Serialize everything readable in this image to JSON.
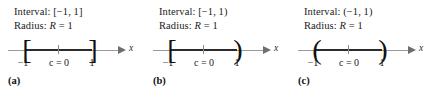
{
  "figure": {
    "type": "number-line-intervals",
    "axis_label": "x",
    "panels": [
      {
        "caption": "(a)",
        "interval_line": "Interval: [−1, 1]",
        "radius_line_prefix": "Radius: ",
        "radius_line_var": "R",
        "radius_line_suffix": " = 1",
        "left_delimiter": "[",
        "right_delimiter": "]",
        "left_tick_label": "−1",
        "center_tick_label": "c = 0",
        "right_tick_label": "1"
      },
      {
        "caption": "(b)",
        "interval_line": "Interval: [−1, 1)",
        "radius_line_prefix": "Radius: ",
        "radius_line_var": "R",
        "radius_line_suffix": " = 1",
        "left_delimiter": "[",
        "right_delimiter": ")",
        "left_tick_label": "−1",
        "center_tick_label": "c = 0",
        "right_tick_label": "1"
      },
      {
        "caption": "(c)",
        "interval_line": "Interval: (−1, 1)",
        "radius_line_prefix": "Radius: ",
        "radius_line_var": "R",
        "radius_line_suffix": " = 1",
        "left_delimiter": "(",
        "right_delimiter": ")",
        "left_tick_label": "−1",
        "center_tick_label": "c = 0",
        "right_tick_label": "1"
      }
    ]
  },
  "chart_data": {
    "type": "line",
    "title": "",
    "xlabel": "x",
    "ylabel": "",
    "grid": false,
    "legend": null,
    "series": [
      {
        "name": "(a) closed interval",
        "interval_text": "Interval: [−1, 1]",
        "radius_text": "Radius: R = 1",
        "center": 0,
        "radius": 1,
        "endpoints": [
          -1,
          1
        ],
        "left_closed": true,
        "right_closed": true,
        "tick_labels": [
          "−1",
          "c = 0",
          "1"
        ],
        "caption": "(a)"
      },
      {
        "name": "(b) half-open interval",
        "interval_text": "Interval: [−1, 1)",
        "radius_text": "Radius: R = 1",
        "center": 0,
        "radius": 1,
        "endpoints": [
          -1,
          1
        ],
        "left_closed": true,
        "right_closed": false,
        "tick_labels": [
          "−1",
          "c = 0",
          "1"
        ],
        "caption": "(b)"
      },
      {
        "name": "(c) open interval",
        "interval_text": "Interval: (−1, 1)",
        "radius_text": "Radius: R = 1",
        "center": 0,
        "radius": 1,
        "endpoints": [
          -1,
          1
        ],
        "left_closed": false,
        "right_closed": false,
        "tick_labels": [
          "−1",
          "c = 0",
          "1"
        ],
        "caption": "(c)"
      }
    ]
  }
}
